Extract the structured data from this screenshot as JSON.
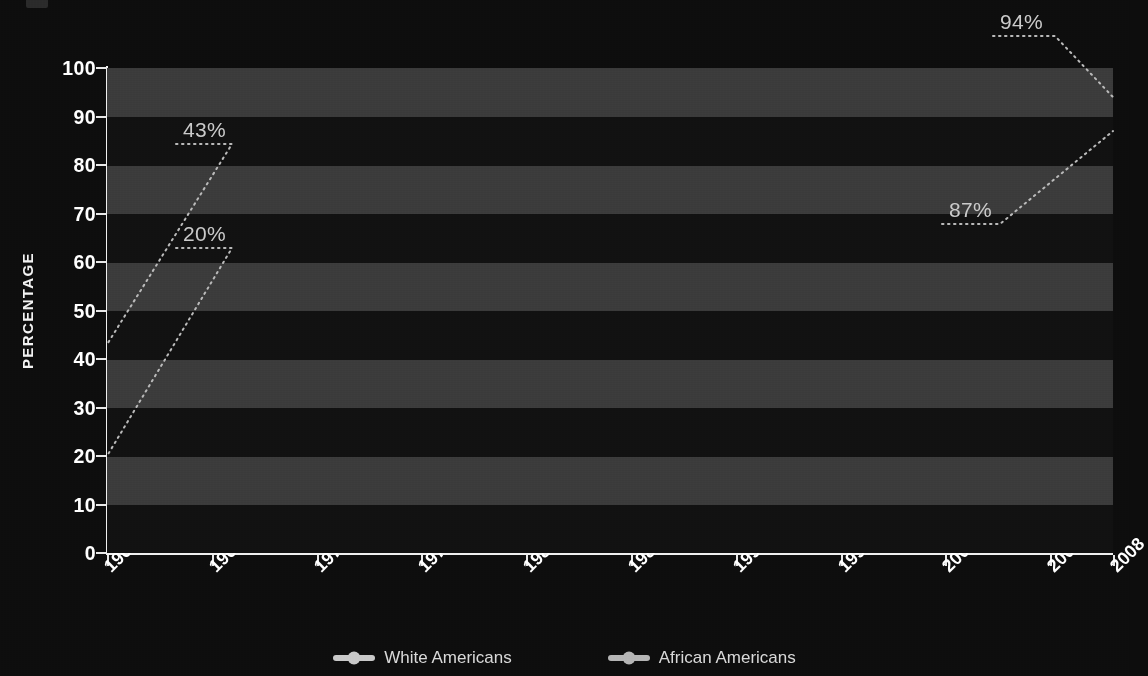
{
  "chart_data": {
    "type": "line",
    "title": "",
    "subtitle": "",
    "xlabel": "",
    "ylabel": "PERCENTAGE",
    "x": [
      1960,
      1965,
      1970,
      1975,
      1980,
      1985,
      1990,
      1995,
      2000,
      2005,
      2008
    ],
    "categories": [
      "1960",
      "1965",
      "1970",
      "1975",
      "1980",
      "1985",
      "1990",
      "1995",
      "2000",
      "2005",
      "2008"
    ],
    "series": [
      {
        "name": "White Americans",
        "color": "#c8c8c8",
        "values": [
          43,
          51.5,
          54,
          63.5,
          68.5,
          75,
          78.5,
          83,
          85,
          86.5,
          94
        ]
      },
      {
        "name": "African Americans",
        "color": "#b4b4b4",
        "values": [
          20,
          27,
          31.5,
          42.5,
          51,
          60,
          67,
          73,
          78.5,
          81.5,
          87
        ]
      }
    ],
    "ylim": [
      0,
      100
    ],
    "ytick_values": [
      0,
      10,
      20,
      30,
      40,
      50,
      60,
      70,
      80,
      90,
      100
    ],
    "ytick_labels": [
      "0",
      "10",
      "20",
      "30",
      "40",
      "50",
      "60",
      "70",
      "80",
      "90",
      "100"
    ],
    "xlim": [
      1960,
      2008
    ],
    "grid": "vertical-dotted + horizontal-banded",
    "legend_position": "bottom-center",
    "annotations": [
      {
        "text": "43%",
        "series": "White Americans",
        "x": 1960,
        "y": 43
      },
      {
        "text": "20%",
        "series": "African Americans",
        "x": 1960,
        "y": 20
      },
      {
        "text": "94%",
        "series": "White Americans",
        "x": 2008,
        "y": 94
      },
      {
        "text": "87%",
        "series": "African Americans",
        "x": 2008,
        "y": 87
      }
    ]
  },
  "colors": {
    "background": "#0d0d0d",
    "band_light": "#3a3a3a",
    "band_dark": "#111111",
    "axis": "#efefef",
    "tick_text": "#ffffff",
    "annotation_text": "#c9c9c9",
    "legend_text": "#d8d8d8",
    "gridline": "#6e6e6e"
  },
  "legend": {
    "items": [
      {
        "label": "White Americans",
        "marker": "line-dot-marker"
      },
      {
        "label": "African Americans",
        "marker": "line-dot-marker"
      }
    ]
  },
  "axis": {
    "y_title": "PERCENTAGE"
  }
}
